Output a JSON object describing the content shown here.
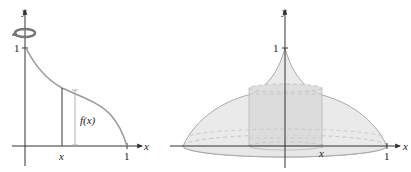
{
  "figure": {
    "left_panel": {
      "title": "Region under y = f(x) rotated about the y-axis",
      "axis_labels": {
        "x": "x",
        "y": "y"
      },
      "ticks": {
        "y_one": "1",
        "x_one": "1",
        "x_var": "x"
      },
      "annotation": "f(x)",
      "rotation_icon": "rotate-about-y-axis-icon",
      "colors": {
        "curve": "#9a9a9a",
        "axis": "#333333",
        "bracket": "#b0b0b0",
        "strip": "#333333"
      }
    },
    "right_panel": {
      "title": "Solid of revolution with cylindrical shell",
      "axis_labels": {
        "x": "x",
        "y": "y"
      },
      "ticks": {
        "y_one": "1",
        "x_one": "1",
        "x_var": "x"
      },
      "colors": {
        "solid_fill": "#e4e4e4",
        "solid_edge": "#a8a8a8",
        "shell_fill": "#d6d6d6",
        "dashed": "#bdbdbd",
        "axis": "#333333"
      }
    }
  }
}
